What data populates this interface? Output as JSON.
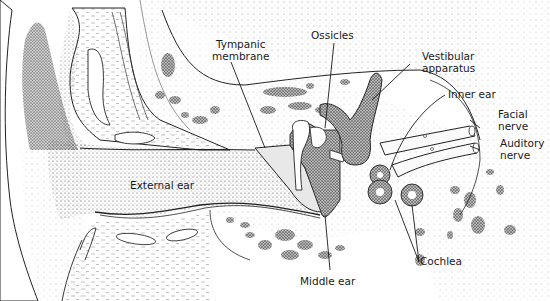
{
  "diagram": {
    "labels": {
      "tympanic_membrane": {
        "line1": "Tympanic",
        "line2": "membrane"
      },
      "ossicles": "Ossicles",
      "vestibular_apparatus": {
        "line1": "Vestibular",
        "line2": "apparatus"
      },
      "inner_ear": "Inner ear",
      "facial_nerve": {
        "line1": "Facial",
        "line2": "nerve"
      },
      "auditory_nerve": {
        "line1": "Auditory",
        "line2": "nerve"
      },
      "external_ear": "External ear",
      "middle_ear": "Middle ear",
      "cochlea": "Cochlea"
    },
    "colors": {
      "ink": "#1a1a1a",
      "stipple": "#555555",
      "background": "#ffffff"
    }
  }
}
